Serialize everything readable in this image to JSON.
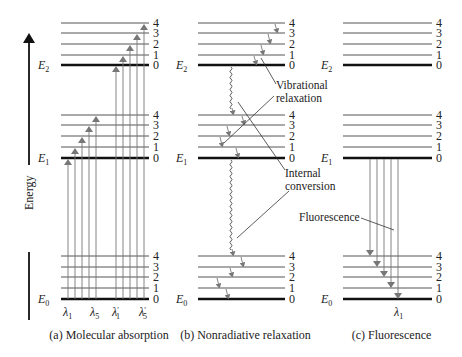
{
  "figure": {
    "axis": {
      "label": "Energy",
      "direction": "up"
    },
    "vibrational_levels": [
      "0",
      "1",
      "2",
      "3",
      "4"
    ],
    "electronic_states": [
      {
        "name": "E",
        "sub": "2"
      },
      {
        "name": "E",
        "sub": "1"
      },
      {
        "name": "E",
        "sub": "0"
      }
    ],
    "panels": [
      {
        "id": "a",
        "caption": "(a) Molecular absorption",
        "wavelength_labels": [
          {
            "sym": "λ",
            "sub": "1",
            "prime": ""
          },
          {
            "sym": "λ",
            "sub": "5",
            "prime": ""
          },
          {
            "sym": "λ",
            "sub": "1",
            "prime": "′"
          },
          {
            "sym": "λ",
            "sub": "5",
            "prime": "′"
          }
        ],
        "transitions": "E0 (v=0) → E1 (v=0..4) and E0 (v=0) → E2 (v=0..4), upward arrows"
      },
      {
        "id": "b",
        "caption": "(b) Nonradiative relaxation",
        "annotations": {
          "vibrational_relaxation": [
            "Vibrational",
            "relaxation"
          ],
          "internal_conversion": [
            "Internal",
            "conversion"
          ]
        },
        "transitions": "stepwise downward vibrational relaxation within E2, E1, E0; wavy internal conversion E2→E1 and E1→E0"
      },
      {
        "id": "c",
        "caption": "(c) Fluorescence",
        "annotations": {
          "fluorescence": "Fluorescence"
        },
        "wavelength_labels": [
          {
            "sym": "λ",
            "sub": "1",
            "prime": ""
          }
        ],
        "transitions": "E1 (v=0) → E0 (v=4..0), downward arrows"
      }
    ]
  }
}
